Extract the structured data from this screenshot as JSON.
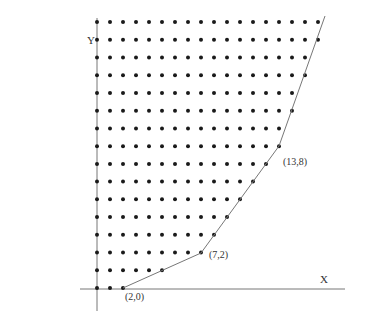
{
  "diagram": {
    "type": "lattice-points-with-boundary",
    "axes": {
      "x_label": "X",
      "y_label": "Y"
    },
    "grid": {
      "rows": 16,
      "origin_px": [
        97,
        288
      ],
      "col_spacing_px": 13.0,
      "row_spacing_px": 17.73,
      "row_last_col": [
        2,
        5,
        8,
        9,
        10,
        11,
        12,
        13,
        14,
        14,
        15,
        15,
        16,
        16,
        17,
        17
      ]
    },
    "boundary_vertices": [
      {
        "label": "(2,0)",
        "px": [
          123,
          288
        ],
        "label_px": [
          125,
          300
        ]
      },
      {
        "label": "(7,2)",
        "px": [
          201,
          253
        ],
        "label_px": [
          209,
          258
        ]
      },
      {
        "label": "(13,8)",
        "px": [
          279,
          146
        ],
        "label_px": [
          283,
          165
        ]
      }
    ],
    "boundary_end_px": [
      325,
      16
    ],
    "colors": {
      "dot": "#1a1a1a",
      "axis": "#555555",
      "boundary": "#777777",
      "label": "#333333"
    }
  }
}
